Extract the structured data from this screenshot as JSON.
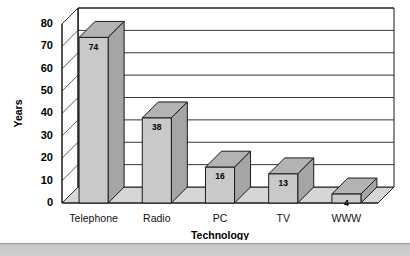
{
  "chart_data": {
    "type": "bar",
    "title": "",
    "xlabel": "Technology",
    "ylabel": "Years",
    "categories": [
      "Telephone",
      "Radio",
      "PC",
      "TV",
      "WWW"
    ],
    "values": [
      74,
      38,
      16,
      13,
      4
    ],
    "ylim": [
      0,
      80
    ],
    "yticks": [
      0,
      10,
      20,
      30,
      40,
      50,
      60,
      70,
      80
    ],
    "ytick_labels": [
      "0",
      "10",
      "20",
      "30",
      "40",
      "50",
      "60",
      "70",
      "80"
    ],
    "grid": true,
    "legend": "none",
    "style": "3d-column",
    "colors": {
      "bar_front": "#c9c9c9",
      "bar_side": "#a5a5a5",
      "bar_top": "#b3b3b3",
      "floor": "#d6d6d6",
      "outline": "#1a1a1a",
      "background": "#ffffff",
      "footer_band": "#c2c2c2"
    },
    "data_labels": [
      "74",
      "38",
      "16",
      "13",
      "4"
    ]
  },
  "footer": {
    "band_label": "page-footer-band"
  }
}
